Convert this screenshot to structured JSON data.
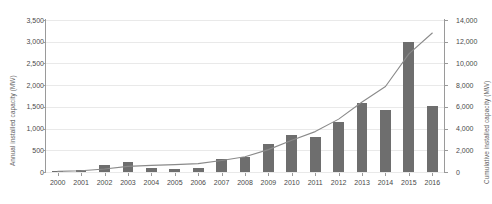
{
  "chart_data": {
    "type": "bar",
    "title": "",
    "subtitle": "",
    "xlabel": "",
    "ylabel": "Annual installed capacity (MW)",
    "y2label": "Cumulative installed capacity (MW)",
    "grid": true,
    "legend": "none",
    "categories": [
      "2000",
      "2001",
      "2002",
      "2003",
      "2004",
      "2005",
      "2006",
      "2007",
      "2008",
      "2009",
      "2010",
      "2011",
      "2012",
      "2013",
      "2014",
      "2015",
      "2016"
    ],
    "ylim": [
      0,
      3500
    ],
    "y2lim": [
      0,
      14000
    ],
    "yticks": [
      "0",
      "500",
      "1,000",
      "1,500",
      "2,000",
      "2,500",
      "3,000",
      "3,500"
    ],
    "ytick_values": [
      0,
      500,
      1000,
      1500,
      2000,
      2500,
      3000,
      3500
    ],
    "y2ticks": [
      "0",
      "2,000",
      "4,000",
      "6,000",
      "8,000",
      "10,000",
      "12,000",
      "14,000"
    ],
    "y2tick_values": [
      0,
      2000,
      4000,
      6000,
      8000,
      10000,
      12000,
      14000
    ],
    "series": [
      {
        "name": "Annual installed capacity",
        "type": "bar",
        "axis": "left",
        "color": "#6e6e6e",
        "values": [
          10,
          50,
          170,
          240,
          90,
          70,
          90,
          290,
          350,
          650,
          860,
          800,
          1150,
          1580,
          1430,
          3000,
          1520
        ]
      },
      {
        "name": "Cumulative installed capacity",
        "type": "line",
        "axis": "right",
        "color": "#8a8a8a",
        "values": [
          60,
          110,
          280,
          520,
          610,
          680,
          770,
          1060,
          1410,
          2060,
          2920,
          3720,
          4870,
          6450,
          7880,
          10880,
          12800
        ]
      }
    ]
  }
}
